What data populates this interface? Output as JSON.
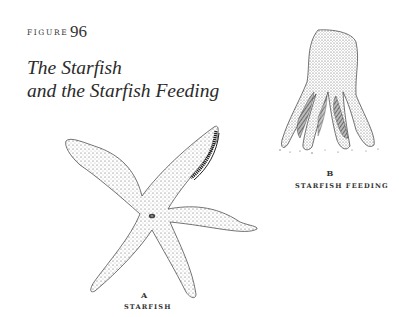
{
  "figure": {
    "label": "FIGURE",
    "number": "96",
    "title_line1": "The Starfish",
    "title_line2": "and the Starfish Feeding"
  },
  "panels": [
    {
      "letter": "A",
      "caption": "STARFISH"
    },
    {
      "letter": "B",
      "caption": "STARFISH FEEDING"
    }
  ],
  "colors": {
    "ink": "#2a2a2a",
    "paper": "#ffffff"
  }
}
